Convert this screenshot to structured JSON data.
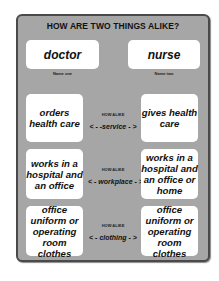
{
  "title": "HOW ARE TWO THINGS ALIKE?",
  "items": {
    "one": {
      "name": "doctor",
      "label": "Name one"
    },
    "two": {
      "name": "nurse",
      "label": "Name two"
    }
  },
  "rows": [
    {
      "left": "orders health care",
      "how_label": "HOW ALIKE",
      "how": "< - -service - >",
      "right": "gives health care"
    },
    {
      "left": "works in a hospital and an office",
      "how_label": "HOW ALIKE",
      "how": "< - workplace - >",
      "right": "works in a hospital and an office or home"
    },
    {
      "left": "office uniform or operating room clothes",
      "how_label": "HOW ALIKE",
      "how": "< - clothing - >",
      "right": "office uniform or operating room clothes"
    }
  ],
  "colors": {
    "panel": "#a6a6a6",
    "border": "#4a4a4a",
    "box": "#ffffff"
  }
}
